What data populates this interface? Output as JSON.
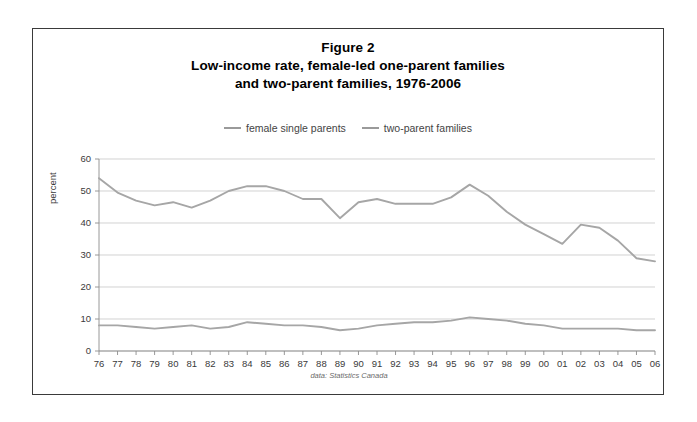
{
  "figure": {
    "title_lines": [
      "Figure 2",
      "Low-income rate, female-led one-parent families",
      "and two-parent families, 1976-2006"
    ],
    "source_note": "data: Statistics Canada",
    "y_axis_title": "percent",
    "line_color": "#a6a6a6",
    "grid_color": "#bfbfbf",
    "border_color": "#3a3a3a"
  },
  "chart_data": {
    "type": "line",
    "xlabel": "",
    "ylabel": "percent",
    "ylim": [
      0,
      60
    ],
    "ytick_values": [
      0,
      10,
      20,
      30,
      40,
      50,
      60
    ],
    "ytick_labels": [
      "0",
      "10",
      "20",
      "30",
      "40",
      "50",
      "60"
    ],
    "grid": true,
    "legend_position": "top-center",
    "categories": [
      "76",
      "77",
      "78",
      "79",
      "80",
      "81",
      "82",
      "83",
      "84",
      "85",
      "86",
      "87",
      "88",
      "89",
      "90",
      "91",
      "92",
      "93",
      "94",
      "95",
      "96",
      "97",
      "98",
      "99",
      "00",
      "01",
      "02",
      "03",
      "04",
      "05",
      "06"
    ],
    "x_full_years": [
      1976,
      1977,
      1978,
      1979,
      1980,
      1981,
      1982,
      1983,
      1984,
      1985,
      1986,
      1987,
      1988,
      1989,
      1990,
      1991,
      1992,
      1993,
      1994,
      1995,
      1996,
      1997,
      1998,
      1999,
      2000,
      2001,
      2002,
      2003,
      2004,
      2005,
      2006
    ],
    "series": [
      {
        "name": "female single parents",
        "color": "#a6a6a6",
        "values": [
          54.0,
          49.5,
          47.0,
          45.5,
          46.5,
          44.8,
          47.0,
          50.0,
          51.5,
          51.5,
          50.0,
          47.5,
          47.5,
          41.5,
          46.5,
          47.5,
          46.0,
          46.0,
          46.0,
          48.0,
          52.0,
          48.5,
          43.5,
          39.5,
          36.5,
          33.5,
          39.5,
          38.5,
          34.5,
          29.0,
          28.0
        ]
      },
      {
        "name": "two-parent families",
        "color": "#a6a6a6",
        "values": [
          8.0,
          8.0,
          7.5,
          7.0,
          7.5,
          8.0,
          7.0,
          7.5,
          9.0,
          8.5,
          8.0,
          8.0,
          7.5,
          6.5,
          7.0,
          8.0,
          8.5,
          9.0,
          9.0,
          9.5,
          10.5,
          10.0,
          9.5,
          8.5,
          8.0,
          7.0,
          7.0,
          7.0,
          7.0,
          6.5,
          6.5
        ]
      }
    ]
  },
  "legend": {
    "items": [
      {
        "label": "female single parents"
      },
      {
        "label": "two-parent families"
      }
    ]
  }
}
